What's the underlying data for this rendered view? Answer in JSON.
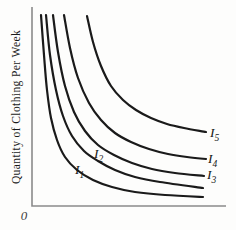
{
  "figure": {
    "width": 236,
    "height": 230,
    "background": "#fdfdfc"
  },
  "chart_data": {
    "type": "line",
    "title": "",
    "xlabel": "",
    "ylabel": "Quantity of Clothing Per Week",
    "origin_label": "0",
    "axes_numeric_ticks": "none (schematic indifference-curve map, axes unlabeled except origin 0)",
    "legend": "curve labels drawn beside curves",
    "colors": {
      "curve": "#1a1a1a",
      "axis": "#8a8a8a",
      "text": "#1b1b1b"
    },
    "layout": {
      "axis_top": [
        32,
        7
      ],
      "axis_corner": [
        32,
        206
      ],
      "axis_right": [
        226,
        206
      ],
      "curve_width": 2.2,
      "axis_width": 1.6
    },
    "series": [
      {
        "id": "I1",
        "label": {
          "base": "I",
          "sub": "1",
          "x": 75,
          "y": 174
        },
        "points": [
          [
            41,
            15
          ],
          [
            44,
            55
          ],
          [
            47,
            90
          ],
          [
            51,
            118
          ],
          [
            57,
            140
          ],
          [
            65,
            157
          ],
          [
            77,
            170
          ],
          [
            93,
            180
          ],
          [
            112,
            187
          ],
          [
            135,
            192
          ],
          [
            165,
            195
          ],
          [
            203,
            197
          ]
        ]
      },
      {
        "id": "I2",
        "label": {
          "base": "I",
          "sub": "2",
          "x": 94,
          "y": 158
        },
        "points": [
          [
            46,
            15
          ],
          [
            50,
            55
          ],
          [
            56,
            90
          ],
          [
            63,
            116
          ],
          [
            72,
            136
          ],
          [
            84,
            151
          ],
          [
            98,
            161
          ],
          [
            115,
            170
          ],
          [
            135,
            177
          ],
          [
            160,
            182
          ],
          [
            203,
            188
          ]
        ]
      },
      {
        "id": "I3",
        "label": {
          "base": "I",
          "sub": "3",
          "x": 207,
          "y": 179
        },
        "points": [
          [
            53,
            15
          ],
          [
            58,
            52
          ],
          [
            65,
            86
          ],
          [
            74,
            112
          ],
          [
            85,
            131
          ],
          [
            98,
            145
          ],
          [
            114,
            155
          ],
          [
            132,
            163
          ],
          [
            152,
            169
          ],
          [
            175,
            173
          ],
          [
            204,
            176
          ]
        ]
      },
      {
        "id": "I4",
        "label": {
          "base": "I",
          "sub": "4",
          "x": 208,
          "y": 163
        },
        "points": [
          [
            64,
            15
          ],
          [
            70,
            48
          ],
          [
            78,
            78
          ],
          [
            89,
            103
          ],
          [
            101,
            120
          ],
          [
            115,
            133
          ],
          [
            131,
            142
          ],
          [
            149,
            149
          ],
          [
            168,
            154
          ],
          [
            187,
            157
          ],
          [
            206,
            159
          ]
        ]
      },
      {
        "id": "I5",
        "label": {
          "base": "I",
          "sub": "5",
          "x": 210,
          "y": 137
        },
        "points": [
          [
            87,
            16
          ],
          [
            93,
            42
          ],
          [
            101,
            66
          ],
          [
            111,
            86
          ],
          [
            123,
            100
          ],
          [
            136,
            110
          ],
          [
            151,
            118
          ],
          [
            167,
            124
          ],
          [
            184,
            128
          ],
          [
            206,
            132
          ]
        ]
      }
    ]
  }
}
